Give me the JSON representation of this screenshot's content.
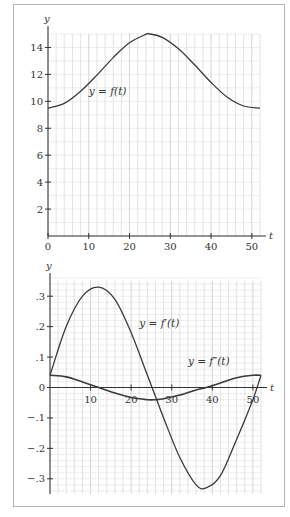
{
  "chart_data": [
    {
      "type": "line",
      "title": "",
      "xlabel": "t",
      "ylabel": "y",
      "xlim": [
        0,
        52
      ],
      "ylim": [
        0,
        15
      ],
      "grid": true,
      "x_ticks": [
        0,
        10,
        20,
        30,
        40,
        50
      ],
      "x_tick_labels": [
        "0",
        "10",
        "20",
        "30",
        "40",
        "50"
      ],
      "y_ticks": [
        2,
        4,
        6,
        8,
        10,
        12,
        14
      ],
      "y_tick_labels": [
        "2",
        "4",
        "6",
        "8",
        "10",
        "12",
        "14"
      ],
      "series": [
        {
          "name": "y = f(t)",
          "x": [
            0,
            4,
            8,
            12,
            16,
            20,
            24,
            25,
            28,
            32,
            36,
            40,
            44,
            48,
            52
          ],
          "y": [
            9.5,
            9.85,
            10.75,
            11.95,
            13.25,
            14.35,
            14.97,
            15.0,
            14.75,
            13.9,
            12.7,
            11.4,
            10.3,
            9.65,
            9.5
          ]
        }
      ],
      "annotations": [
        {
          "text": "y = f(t)",
          "at_t": 10,
          "at_y": 10.5
        }
      ]
    },
    {
      "type": "line",
      "title": "",
      "xlabel": "t",
      "ylabel": "y",
      "xlim": [
        0,
        52
      ],
      "ylim": [
        -0.35,
        0.35
      ],
      "grid": true,
      "x_ticks": [
        10,
        20,
        30,
        40,
        50
      ],
      "x_tick_labels": [
        "10",
        "20",
        "30",
        "40",
        "50"
      ],
      "y_ticks": [
        0.3,
        0.2,
        0.1,
        0,
        -0.1,
        -0.2,
        -0.3
      ],
      "y_tick_labels": [
        ".3",
        ".2",
        ".1",
        "0",
        "−.1",
        "−.2",
        "−.3"
      ],
      "series": [
        {
          "name": "y = f′(t)",
          "x": [
            0,
            4,
            8,
            12,
            16,
            20,
            24,
            26,
            28,
            32,
            36,
            38.5,
            42,
            46,
            50,
            52
          ],
          "y": [
            0.04,
            0.2,
            0.3,
            0.33,
            0.29,
            0.18,
            0.04,
            -0.03,
            -0.1,
            -0.23,
            -0.32,
            -0.33,
            -0.29,
            -0.17,
            -0.04,
            0.04
          ]
        },
        {
          "name": "y = f″(t)",
          "x": [
            0,
            4,
            8,
            12,
            16,
            20,
            24,
            26,
            28,
            32,
            36,
            38.5,
            42,
            46,
            50,
            52
          ],
          "y": [
            0.04,
            0.035,
            0.018,
            0.0,
            -0.018,
            -0.033,
            -0.04,
            -0.04,
            -0.037,
            -0.025,
            -0.008,
            0.0,
            0.015,
            0.032,
            0.04,
            0.04
          ]
        }
      ],
      "annotations": [
        {
          "text": "y = f′(t)",
          "at_t": 22,
          "at_y": 0.2
        },
        {
          "text": "y = f″(t)",
          "at_t": 34,
          "at_y": 0.075
        }
      ]
    }
  ]
}
